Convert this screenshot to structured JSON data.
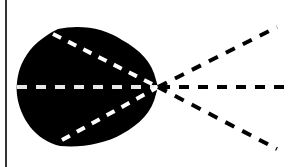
{
  "diagram": {
    "colors": {
      "background": "#ffffff",
      "blob": "#000000",
      "border": "#333333",
      "dash_inside": "#ffffff",
      "dash_outside": "#000000"
    },
    "focal_point": {
      "x": 158,
      "y": 87
    },
    "rays": [
      {
        "name": "upper-ray",
        "end": {
          "x": 277,
          "y": 27
        }
      },
      {
        "name": "center-ray",
        "end": {
          "x": 291,
          "y": 87
        }
      },
      {
        "name": "lower-ray",
        "end": {
          "x": 277,
          "y": 149
        }
      }
    ],
    "inner_rays": [
      {
        "name": "upper-inner-ray",
        "start": {
          "x": 53,
          "y": 34
        }
      },
      {
        "name": "center-inner-ray",
        "start": {
          "x": 17,
          "y": 87
        }
      },
      {
        "name": "lower-inner-ray",
        "start": {
          "x": 62,
          "y": 140
        }
      }
    ]
  }
}
